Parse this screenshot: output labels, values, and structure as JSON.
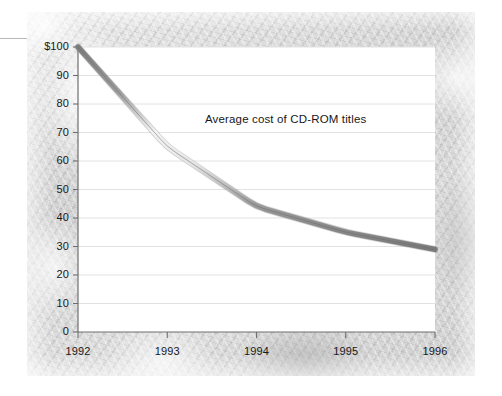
{
  "chart_data": {
    "type": "line",
    "title": "Average cost of CD-ROM titles",
    "xlabel": "",
    "ylabel": "",
    "x": [
      "1992",
      "1993",
      "1994",
      "1995",
      "1996"
    ],
    "values": [
      100,
      65,
      44,
      35,
      29
    ],
    "ylim": [
      0,
      100
    ],
    "yticks": [
      0,
      10,
      20,
      30,
      40,
      50,
      60,
      70,
      80,
      90,
      100
    ],
    "ytick_labels": [
      "0",
      "10",
      "20",
      "30",
      "40",
      "50",
      "60",
      "70",
      "80",
      "90",
      "$100"
    ],
    "xtick_labels": [
      "1992",
      "1993",
      "1994",
      "1995",
      "1996"
    ],
    "grid": true,
    "grid_axis": "y",
    "legend": "none",
    "series_name": "Average cost of CD-ROM titles",
    "units": "US dollars",
    "colors": {
      "line": "#8c8c8c",
      "line_highlight": "#f2f2f2",
      "gridline": "#e2e2e2",
      "axis": "#6e6e6e",
      "plot_background": "#ffffff",
      "panel_background": "#d9d9d9",
      "text": "#17171a"
    }
  }
}
